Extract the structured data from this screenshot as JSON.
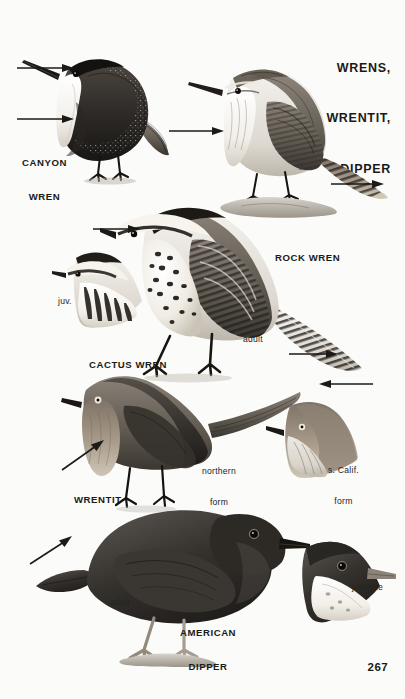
{
  "plate": {
    "title_lines": [
      "WRENS,",
      "WRENTIT,",
      "DIPPER"
    ],
    "page_number": "267",
    "background_color": "#fbfbfa",
    "ink_color": "#1a1a18"
  },
  "species_labels": [
    {
      "id": "canyon-wren",
      "text_lines": [
        "CANYON",
        "WREN"
      ]
    },
    {
      "id": "rock-wren",
      "text_lines": [
        "ROCK WREN"
      ]
    },
    {
      "id": "cactus-wren",
      "text_lines": [
        "CACTUS WREN"
      ]
    },
    {
      "id": "wrentit",
      "text_lines": [
        "WRENTIT"
      ]
    },
    {
      "id": "american-dipper",
      "text_lines": [
        "AMERICAN",
        "DIPPER"
      ]
    }
  ],
  "annotations": [
    {
      "id": "cactus-wren-juvenile",
      "text": "juv."
    },
    {
      "id": "cactus-wren-adult",
      "text": "adult"
    },
    {
      "id": "wrentit-northern-form",
      "text_lines": [
        "northern",
        "form"
      ]
    },
    {
      "id": "wrentit-scalif-form",
      "text_lines": [
        "s. Calif.",
        "form"
      ]
    },
    {
      "id": "dipper-adult",
      "text": "adult"
    },
    {
      "id": "dipper-juvenile",
      "text": "juvenile"
    }
  ],
  "figures": [
    {
      "id": "canyon-wren-figure",
      "common_name": "Canyon Wren",
      "pose": "perched, facing left",
      "plumage": "dark rufous-brown body with fine white spotting, pure white throat and breast, long slender decurved bill"
    },
    {
      "id": "rock-wren-figure",
      "common_name": "Rock Wren",
      "pose": "perched on rock, facing left",
      "plumage": "pale gray-brown above with fine speckling, whitish underparts, barred tail with buff tail tips"
    },
    {
      "id": "cactus-wren-figure",
      "common_name": "Cactus Wren",
      "pose": "standing, facing left",
      "plumage": "bold white supercilium, heavily black-spotted breast, barred wings and long barred tail"
    },
    {
      "id": "cactus-wren-juv-head",
      "common_name": "Cactus Wren",
      "pose": "head-and-shoulders vignette",
      "plumage": "juvenile: duller, more diffuse streaking below"
    },
    {
      "id": "wrentit-figure",
      "common_name": "Wrentit",
      "pose": "perched, facing left",
      "plumage": "grayish-brown above, warm buff breast with faint streaks, very long tail, pale whitish eye"
    },
    {
      "id": "wrentit-scalif-head",
      "common_name": "Wrentit",
      "pose": "head vignette",
      "plumage": "s. Calif. form: browner, warmer toned"
    },
    {
      "id": "dipper-figure",
      "common_name": "American Dipper",
      "pose": "standing on rock, facing right",
      "plumage": "uniform slate-gray, stubby cocked tail, pale pinkish legs"
    },
    {
      "id": "dipper-juv-head",
      "common_name": "American Dipper",
      "pose": "head vignette",
      "plumage": "juvenile: pale whitish throat and breast, pale bill"
    }
  ],
  "pointer_count": 9
}
